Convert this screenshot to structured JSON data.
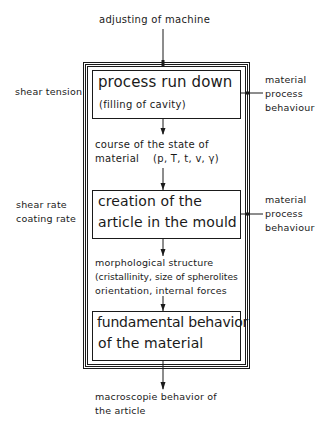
{
  "diagram": {
    "top_input": "adjusting of machine",
    "stages": [
      {
        "title_lines": [
          "process run down"
        ],
        "subtitle": "(filling of cavity)",
        "left_label": [
          "shear tension"
        ],
        "right_label": [
          "material",
          "process",
          "behaviour"
        ]
      },
      {
        "title_lines": [
          "creation of the",
          "article in the mould"
        ],
        "left_label": [
          "shear rate",
          "coating rate"
        ],
        "right_label": [
          "material",
          "process",
          "behaviour"
        ]
      },
      {
        "title_lines": [
          "fundamental behavior",
          "of the material"
        ]
      }
    ],
    "transitions": [
      {
        "lines": [
          "course of the state of",
          "material    (p, T, t, v, γ)"
        ]
      },
      {
        "lines": [
          "morphological structure",
          "(cristallinity, size of spherolites",
          "orientation, internal forces"
        ]
      }
    ],
    "bottom_output": [
      "macroscopie behavior of",
      "the article"
    ],
    "colors": {
      "line": "#1a1a1a",
      "background": "#ffffff"
    }
  }
}
